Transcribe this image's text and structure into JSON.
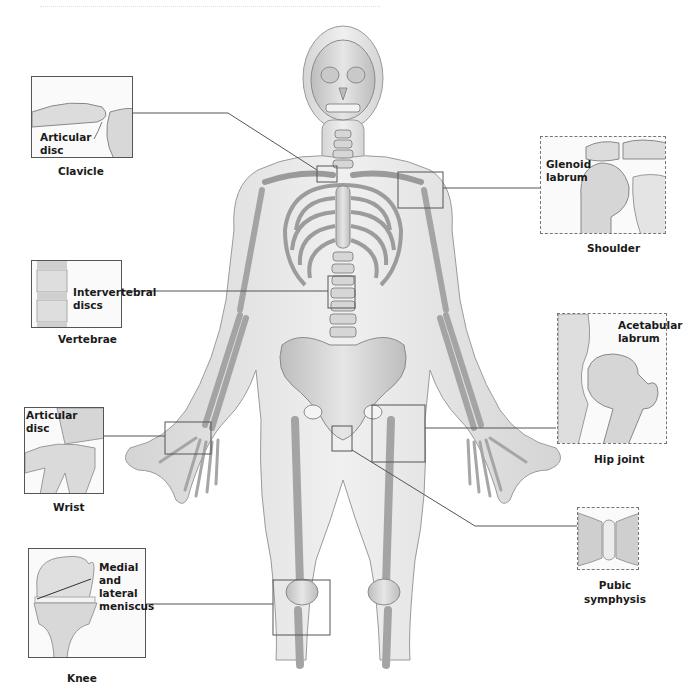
{
  "figure": {
    "colors": {
      "bone": "#d9d9d9",
      "body": "#e8e8e8",
      "outline": "#8a8a8a",
      "callout_line": "#555555"
    }
  },
  "insets": [
    {
      "id": "clavicle",
      "labels": [
        "Articular",
        "disc"
      ],
      "caption": "Clavicle"
    },
    {
      "id": "shoulder",
      "labels": [
        "Glenoid",
        "labrum"
      ],
      "caption": "Shoulder"
    },
    {
      "id": "vertebrae",
      "labels": [
        "Intervertebral",
        "discs"
      ],
      "caption": "Vertebrae"
    },
    {
      "id": "hip",
      "labels": [
        "Acetabular",
        "labrum"
      ],
      "caption": "Hip joint"
    },
    {
      "id": "wrist",
      "labels": [
        "Articular",
        "disc"
      ],
      "caption": "Wrist"
    },
    {
      "id": "pubic",
      "labels": [],
      "caption_lines": [
        "Pubic",
        "symphysis"
      ]
    },
    {
      "id": "knee",
      "labels": [
        "Medial",
        "and",
        "lateral",
        "meniscus"
      ],
      "caption": "Knee"
    }
  ]
}
